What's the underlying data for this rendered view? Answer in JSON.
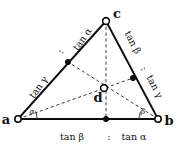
{
  "figure": {
    "type": "geometry-diagram",
    "background_color": "#ffffff",
    "line_color": "#0d0d0d",
    "dashed_color": "#3a3a3a",
    "vertices": [
      {
        "id": "a",
        "label": "a",
        "x": 18,
        "y": 119,
        "marker": "open-circle"
      },
      {
        "id": "b",
        "label": "b",
        "x": 158,
        "y": 119,
        "marker": "open-circle"
      },
      {
        "id": "c",
        "label": "c",
        "x": 106,
        "y": 21,
        "marker": "open-circle"
      }
    ],
    "interior_point": {
      "id": "d",
      "label": "d",
      "x": 104,
      "y": 88,
      "marker": "open-circle"
    },
    "cevian_feet": [
      {
        "id": "foot-ca",
        "label": "",
        "x": 68,
        "y": 62,
        "marker": "filled-dot",
        "on_edge": "a-c"
      },
      {
        "id": "foot-cb",
        "label": "",
        "x": 133,
        "y": 78,
        "marker": "filled-dot",
        "on_edge": "b-c"
      },
      {
        "id": "foot-ab",
        "label": "",
        "x": 106,
        "y": 119,
        "marker": "filled-dot",
        "on_edge": "a-b"
      }
    ],
    "edge_ratio_labels": [
      {
        "id": "label-ac-upper",
        "text": "tan α",
        "x": 85,
        "y": 41,
        "rotation": -55,
        "edge": "a-c",
        "segment": "upper"
      },
      {
        "id": "label-ac-lower",
        "text": "tan γ",
        "x": 41,
        "y": 89,
        "rotation": -55,
        "edge": "a-c",
        "segment": "lower"
      },
      {
        "id": "label-bc-upper",
        "text": "tan β",
        "x": 130,
        "y": 44,
        "rotation": 62,
        "edge": "b-c",
        "segment": "upper"
      },
      {
        "id": "label-bc-lower",
        "text": "tan γ",
        "x": 152,
        "y": 88,
        "rotation": 62,
        "edge": "b-c",
        "segment": "lower"
      },
      {
        "id": "label-ab-left",
        "text": "tan β",
        "x": 72,
        "y": 137,
        "rotation": 0,
        "edge": "a-b",
        "segment": "left"
      },
      {
        "id": "label-ab-right",
        "text": "tan α",
        "x": 134,
        "y": 137,
        "rotation": 0,
        "edge": "a-b",
        "segment": "right"
      }
    ],
    "ratio_separators": [
      {
        "id": "sep-ac",
        "text": ":",
        "x": 63,
        "y": 53,
        "rotation": -55
      },
      {
        "id": "sep-bc",
        "text": ":",
        "x": 141,
        "y": 70,
        "rotation": 62
      },
      {
        "id": "sep-ab",
        "text": ":",
        "x": 109,
        "y": 137,
        "rotation": 0
      }
    ],
    "angle_marks": [
      {
        "id": "angle-at-a",
        "label": "α",
        "vertex": "a",
        "label_x": 32,
        "label_y": 114
      },
      {
        "id": "angle-at-b",
        "label": "β",
        "vertex": "b",
        "label_x": 143,
        "label_y": 114
      }
    ]
  }
}
